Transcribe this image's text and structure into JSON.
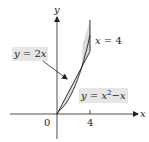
{
  "figure": {
    "type": "region-between-curves",
    "axes": {
      "x_label": "x",
      "y_label": "y",
      "origin_label": "0",
      "x_ticks": [
        {
          "value": 4,
          "label": "4"
        }
      ]
    },
    "curves": [
      {
        "id": "line",
        "label": "y = 2x",
        "equation": "y = 2x"
      },
      {
        "id": "parabola",
        "label": "y = x²−x",
        "equation": "y = x^2 - x"
      },
      {
        "id": "vertical",
        "label": "x = 4",
        "equation": "x = 4"
      }
    ],
    "labels": {
      "line_lhs": "y",
      "line_eq": " = 2",
      "line_var": "x",
      "parabola_lhs": "y",
      "parabola_eq": " = ",
      "parabola_x": "x",
      "parabola_exp": "2",
      "parabola_rest": "−",
      "parabola_x2": "x",
      "vertical_var": "x",
      "vertical_eq": " = 4"
    },
    "intersections": [
      {
        "x": 0,
        "y": 0
      },
      {
        "x": 3,
        "y": 6
      }
    ],
    "colors": {
      "region_fill": "#d9d9d9",
      "label_bg": "#e6e6e6",
      "stroke": "#231f20"
    }
  }
}
